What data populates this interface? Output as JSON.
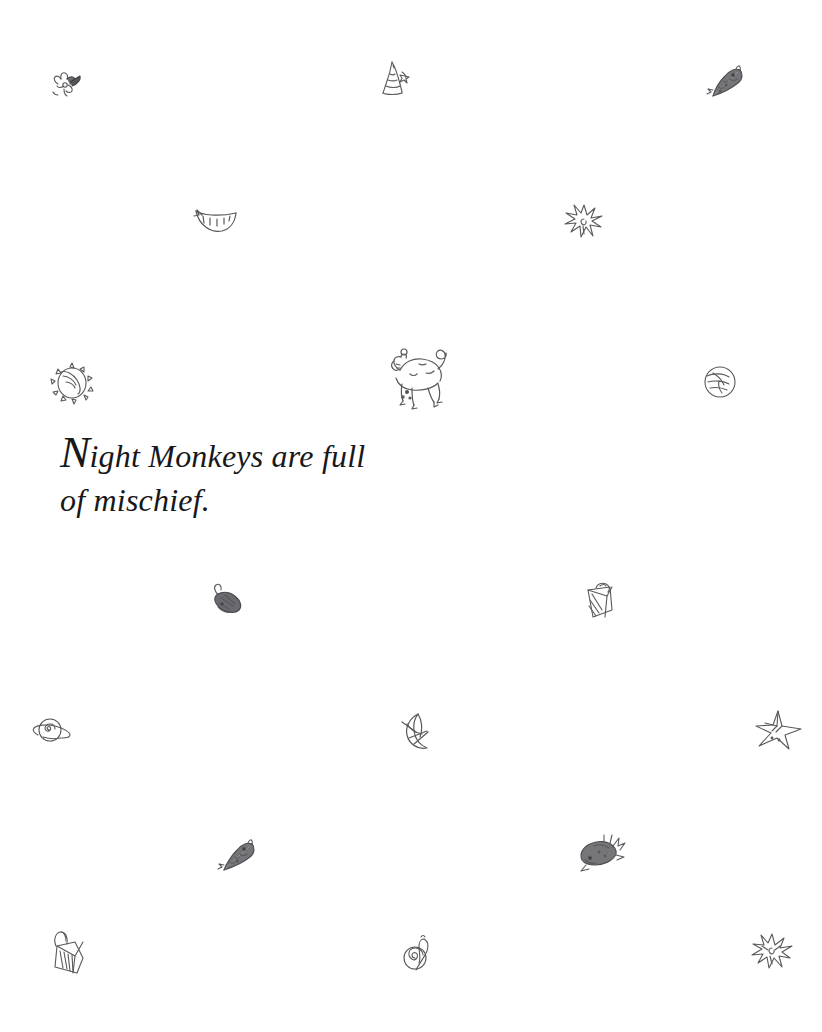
{
  "page": {
    "background_color": "#ffffff",
    "ink_color": "#59595c",
    "text_color": "#18181a",
    "width": 822,
    "height": 1032
  },
  "caption": {
    "initial": "N",
    "line1_rest": "ight Monkeys are full",
    "line2": "of mischief.",
    "full_text": "Night Monkeys are full of mischief."
  },
  "doodles": [
    {
      "name": "flower-doodle",
      "label": "flower",
      "x": 44,
      "y": 62,
      "size": 46
    },
    {
      "name": "wizard-hat-doodle",
      "label": "wizard hat",
      "x": 374,
      "y": 56,
      "size": 46
    },
    {
      "name": "fish-doodle-1",
      "label": "fish",
      "x": 700,
      "y": 62,
      "size": 48
    },
    {
      "name": "smile-doodle",
      "label": "smiling mouth",
      "x": 192,
      "y": 205,
      "size": 44
    },
    {
      "name": "starburst-doodle-1",
      "label": "starburst",
      "x": 562,
      "y": 202,
      "size": 44
    },
    {
      "name": "sun-eye-doodle",
      "label": "sun with eye",
      "x": 48,
      "y": 358,
      "size": 48
    },
    {
      "name": "monkey-doodle",
      "label": "night monkey",
      "x": 374,
      "y": 334,
      "size": 84
    },
    {
      "name": "planet-doodle",
      "label": "planet",
      "x": 700,
      "y": 362,
      "size": 40
    },
    {
      "name": "critter-doodle",
      "label": "critter",
      "x": 205,
      "y": 580,
      "size": 44
    },
    {
      "name": "bucket-doodle",
      "label": "bucket",
      "x": 578,
      "y": 576,
      "size": 46
    },
    {
      "name": "saturn-doodle",
      "label": "saturn",
      "x": 30,
      "y": 708,
      "size": 46
    },
    {
      "name": "crescent-moon-doodle",
      "label": "crescent moon",
      "x": 396,
      "y": 708,
      "size": 48
    },
    {
      "name": "star-doodle",
      "label": "star",
      "x": 752,
      "y": 708,
      "size": 50
    },
    {
      "name": "fish-doodle-2",
      "label": "fish",
      "x": 212,
      "y": 836,
      "size": 48
    },
    {
      "name": "fish-doodle-3",
      "label": "spiny fish",
      "x": 574,
      "y": 832,
      "size": 50
    },
    {
      "name": "bag-doodle",
      "label": "bag",
      "x": 44,
      "y": 928,
      "size": 48
    },
    {
      "name": "snail-doodle",
      "label": "snail",
      "x": 400,
      "y": 932,
      "size": 40
    },
    {
      "name": "starburst-doodle-2",
      "label": "starburst",
      "x": 750,
      "y": 932,
      "size": 42
    }
  ]
}
